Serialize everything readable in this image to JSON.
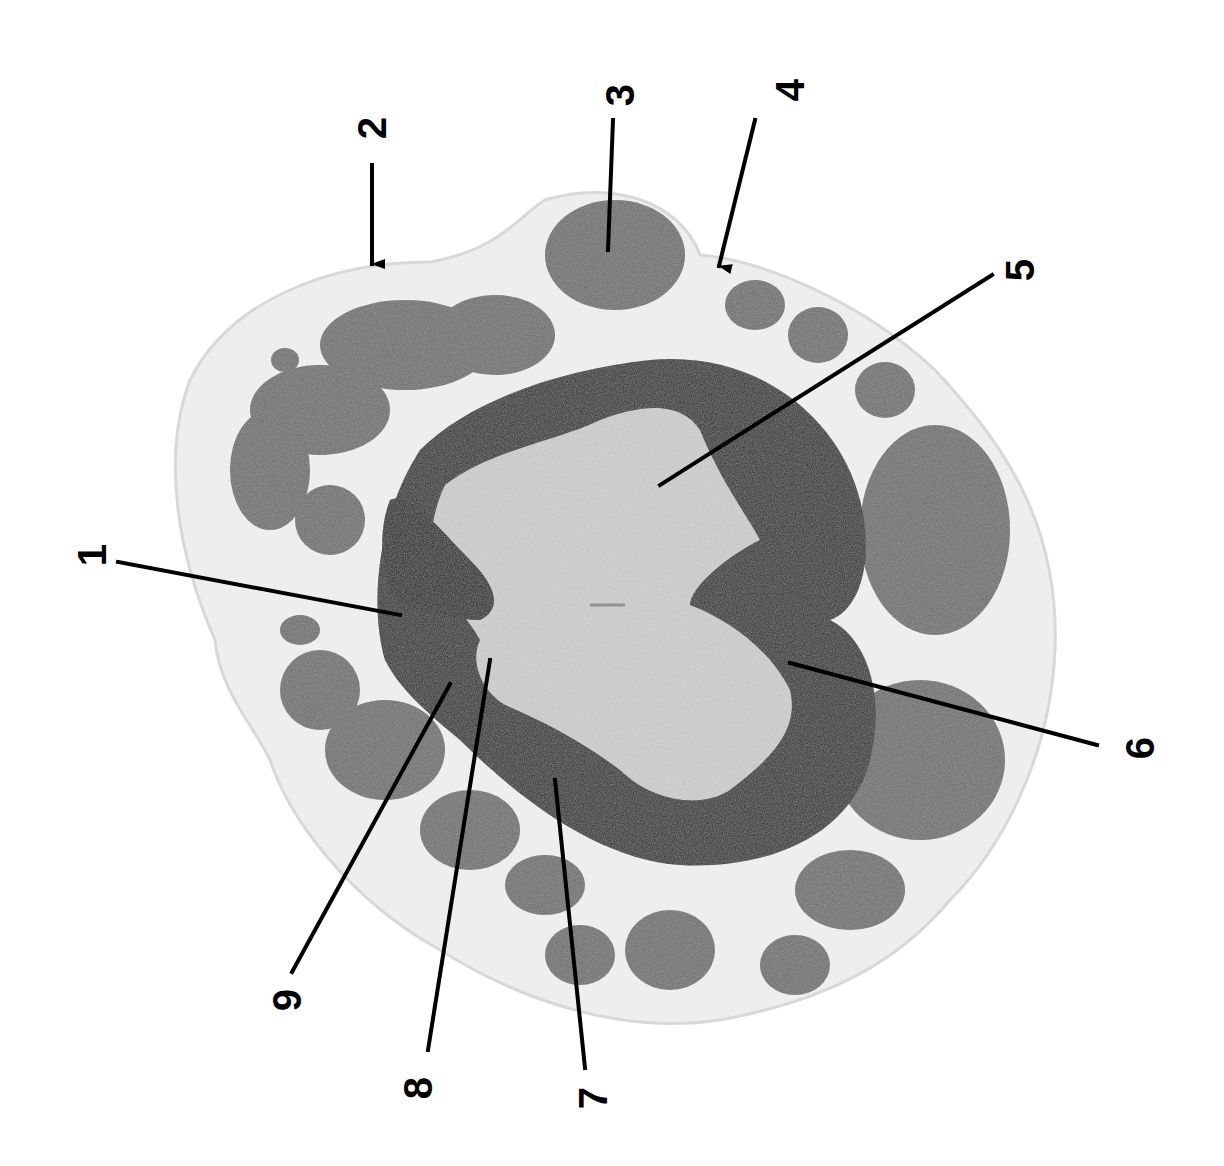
{
  "figure": {
    "type": "histology cross-section with numbered callouts",
    "orientation": "rotated 90 degrees counter-clockwise (labels read bottom-to-top)",
    "colors": {
      "background": "#ffffff",
      "connective_tissue": "#ececec",
      "muscle_bundle": "#6a6a6a",
      "white_matter": "#2a2a2a",
      "gray_matter": "#cfcfcf",
      "leader_line": "#000000"
    }
  },
  "labels": [
    {
      "id": 1,
      "text": "1",
      "x": 72,
      "y": 535,
      "pointer": "line",
      "from": [
        118,
        562
      ],
      "to": [
        400,
        615
      ]
    },
    {
      "id": 2,
      "text": "2",
      "x": 352,
      "y": 108,
      "pointer": "arrow",
      "from": [
        372,
        165
      ],
      "to": [
        372,
        278
      ]
    },
    {
      "id": 3,
      "text": "3",
      "x": 600,
      "y": 75,
      "pointer": "line",
      "from": [
        613,
        120
      ],
      "to": [
        608,
        250
      ]
    },
    {
      "id": 4,
      "text": "4",
      "x": 770,
      "y": 70,
      "pointer": "arrow",
      "from": [
        755,
        120
      ],
      "to": [
        715,
        280
      ]
    },
    {
      "id": 5,
      "text": "5",
      "x": 1000,
      "y": 250,
      "pointer": "line",
      "from": [
        992,
        275
      ],
      "to": [
        660,
        485
      ]
    },
    {
      "id": 6,
      "text": "6",
      "x": 1120,
      "y": 728,
      "pointer": "line",
      "from": [
        1097,
        745
      ],
      "to": [
        790,
        663
      ]
    },
    {
      "id": 7,
      "text": "7",
      "x": 573,
      "y": 1078,
      "pointer": "line",
      "from": [
        585,
        1068
      ],
      "to": [
        555,
        780
      ]
    },
    {
      "id": 8,
      "text": "8",
      "x": 398,
      "y": 1068,
      "pointer": "line",
      "from": [
        428,
        1050
      ],
      "to": [
        490,
        660
      ]
    },
    {
      "id": 9,
      "text": "9",
      "x": 267,
      "y": 980,
      "pointer": "line",
      "from": [
        292,
        972
      ],
      "to": [
        450,
        684
      ]
    }
  ]
}
